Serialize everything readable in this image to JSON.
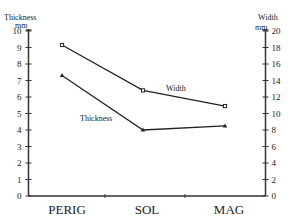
{
  "chart_data": {
    "type": "line",
    "title": "",
    "categories": [
      "PERIG",
      "SOL",
      "MAG"
    ],
    "xlabel": "",
    "ylabel": "Thickness mm",
    "ylabel_right": "Width mm",
    "ylim": [
      0,
      10
    ],
    "ylim_right": [
      0,
      20
    ],
    "yticks": [
      0,
      1,
      2,
      3,
      4,
      5,
      6,
      7,
      8,
      9,
      10
    ],
    "yticks_right": [
      0,
      2,
      4,
      6,
      8,
      10,
      12,
      14,
      16,
      18,
      20
    ],
    "grid": false,
    "legend": "inline labels",
    "series": [
      {
        "name": "Width",
        "axis": "right",
        "marker": "square",
        "values": [
          18.3,
          12.8,
          10.9
        ]
      },
      {
        "name": "Thickness",
        "axis": "left",
        "marker": "triangle",
        "values": [
          7.3,
          4.0,
          4.25
        ]
      }
    ],
    "annotations": [
      {
        "text": "Width",
        "near": "SOL-MAG segment of Width line"
      },
      {
        "text": "Thickness",
        "near": "PERIG-SOL segment of Thickness line"
      }
    ]
  },
  "axis": {
    "left_title_line1": "Thickness",
    "left_title_line2": "mm",
    "right_title_line1": "Width",
    "right_title_line2": "mm"
  }
}
